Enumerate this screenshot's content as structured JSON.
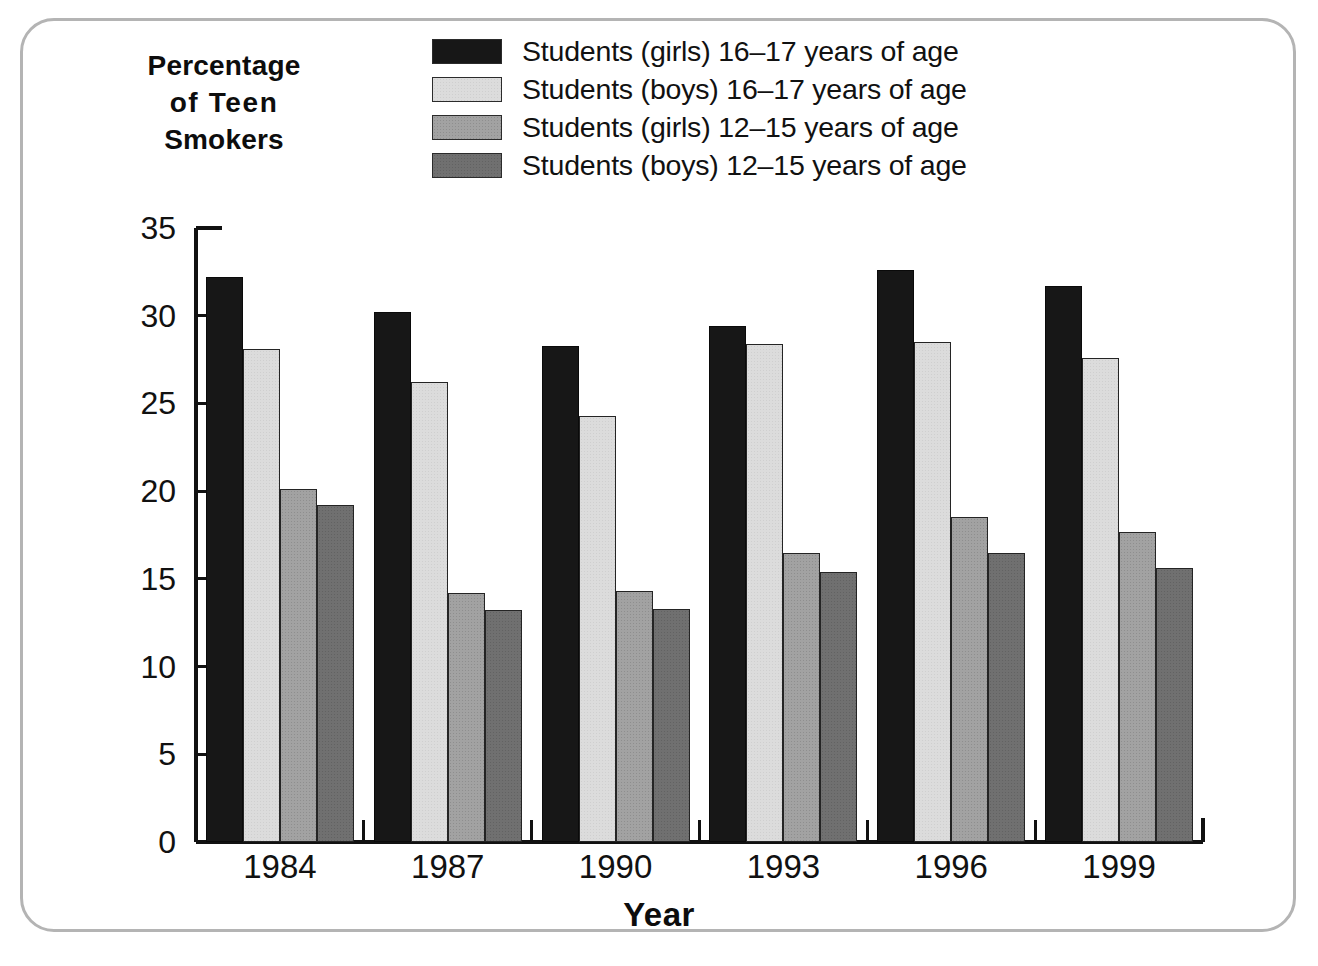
{
  "figure": {
    "frame_color": "#b4b4b4",
    "background": "#ffffff"
  },
  "axis_titles": {
    "y_line1": "Percentage",
    "y_line2": "of  Teen",
    "y_line3": "Smokers",
    "x": "Year"
  },
  "legend": {
    "items": [
      {
        "label": "Students (girls) 16–17 years of age",
        "color": "#171717",
        "swatch": "legend-swatch-girls-16-17"
      },
      {
        "label": "Students (boys) 16–17 years of age",
        "color": "#dcdcdc",
        "swatch": "legend-swatch-boys-16-17"
      },
      {
        "label": "Students (girls) 12–15 years of age",
        "color": "#a2a2a2",
        "swatch": "legend-swatch-girls-12-15"
      },
      {
        "label": "Students (boys) 12–15 years of age",
        "color": "#707070",
        "swatch": "legend-swatch-boys-12-15"
      }
    ]
  },
  "chart_data": {
    "type": "bar",
    "title": "Percentage of Teen Smokers",
    "xlabel": "Year",
    "ylabel": "Percentage of Teen Smokers",
    "categories": [
      "1984",
      "1987",
      "1990",
      "1993",
      "1996",
      "1999"
    ],
    "ylim": [
      0,
      35
    ],
    "yticks": [
      0,
      5,
      10,
      15,
      20,
      25,
      30,
      35
    ],
    "ytick_labels": [
      "0",
      "5",
      "10",
      "15",
      "20",
      "25",
      "30",
      "35"
    ],
    "grid": false,
    "legend_position": "top-right",
    "series": [
      {
        "name": "Students (girls) 16–17 years of age",
        "color": "#171717",
        "values": [
          32.2,
          30.2,
          28.3,
          29.4,
          32.6,
          31.7
        ]
      },
      {
        "name": "Students (boys) 16–17 years of age",
        "color": "#dcdcdc",
        "values": [
          28.1,
          26.2,
          24.3,
          28.4,
          28.5,
          27.6
        ]
      },
      {
        "name": "Students (girls) 12–15 years of age",
        "color": "#a2a2a2",
        "values": [
          20.1,
          14.2,
          14.3,
          16.5,
          18.5,
          17.7
        ]
      },
      {
        "name": "Students (boys) 12–15 years of age",
        "color": "#707070",
        "values": [
          19.2,
          13.2,
          13.3,
          15.4,
          16.5,
          15.6
        ]
      }
    ]
  }
}
